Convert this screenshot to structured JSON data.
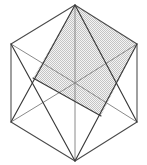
{
  "figure": {
    "type": "geometric-line-diagram",
    "canvas": {
      "width": 147,
      "height": 165
    },
    "background_color": "#ffffff",
    "colors": {
      "outline_stroke": "#4a4a4a",
      "inner_stroke": "#8a8a8a",
      "diagonal_stroke": "#3a3a3a",
      "hatch_fill": "#c9c9c9",
      "hatch_background": "#f2f2f2"
    },
    "stroke_widths": {
      "outline": 1.05,
      "inner": 1.0,
      "diagonal": 1.15
    },
    "vertices": {
      "top": [
        75,
        5
      ],
      "upper_left": [
        11,
        44
      ],
      "upper_right": [
        137,
        44
      ],
      "lower_left": [
        11,
        122
      ],
      "lower_right": [
        137,
        122
      ],
      "bottom": [
        75,
        161
      ],
      "center": [
        75,
        83
      ]
    },
    "hexagon_outline": [
      [
        75,
        5
      ],
      [
        137,
        44
      ],
      [
        137,
        122
      ],
      [
        75,
        161
      ],
      [
        11,
        122
      ],
      [
        11,
        44
      ]
    ],
    "inner_edges": [
      {
        "name": "center-vertical-upper",
        "from": [
          75,
          5
        ],
        "to": [
          75,
          83
        ]
      },
      {
        "name": "center-vertical-lower",
        "from": [
          75,
          83
        ],
        "to": [
          75,
          161
        ]
      },
      {
        "name": "center-horizontal-left",
        "from": [
          11,
          44
        ],
        "to": [
          75,
          83
        ]
      },
      {
        "name": "center-horizontal-right",
        "from": [
          75,
          83
        ],
        "to": [
          137,
          44
        ]
      },
      {
        "name": "center-lower-left",
        "from": [
          11,
          122
        ],
        "to": [
          75,
          83
        ]
      },
      {
        "name": "center-lower-right",
        "from": [
          75,
          83
        ],
        "to": [
          137,
          122
        ]
      }
    ],
    "section_plane_polygon": [
      [
        75,
        5
      ],
      [
        137,
        44
      ],
      [
        101,
        116
      ],
      [
        33,
        78
      ]
    ],
    "section_diagonals": [
      {
        "name": "diagonal-top-to-lower-left",
        "from": [
          75,
          5
        ],
        "to": [
          11,
          122
        ]
      },
      {
        "name": "diagonal-upper-left-to-bottom",
        "from": [
          11,
          44
        ],
        "to": [
          75,
          161
        ]
      },
      {
        "name": "diagonal-upper-right-to-bottom",
        "from": [
          137,
          44
        ],
        "to": [
          75,
          161
        ]
      },
      {
        "name": "diagonal-top-to-lower-right",
        "from": [
          75,
          5
        ],
        "to": [
          137,
          122
        ]
      },
      {
        "name": "section-edge-upper-left",
        "from": [
          33,
          78
        ],
        "to": [
          75,
          5
        ]
      },
      {
        "name": "section-edge-lower-right",
        "from": [
          101,
          116
        ],
        "to": [
          137,
          44
        ]
      },
      {
        "name": "section-edge-long-lower",
        "from": [
          33,
          78
        ],
        "to": [
          101,
          116
        ]
      },
      {
        "name": "section-edge-long-upper",
        "from": [
          75,
          5
        ],
        "to": [
          137,
          44
        ]
      }
    ],
    "labels": []
  }
}
